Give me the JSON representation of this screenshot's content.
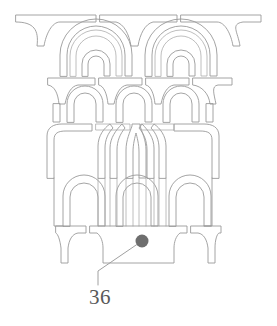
{
  "figure": {
    "background_color": "#ffffff",
    "line_color": "#9a9a9a",
    "line_width": 0.9
  },
  "callout": {
    "number_label": "36",
    "dot_color": "#6e6e6e",
    "dot_radius": 6.5,
    "dot_center_x": 142,
    "dot_center_y": 241,
    "leader_color": "#a0a0a0",
    "leader_points": "142,241 98,271 98,285",
    "label_color": "#595959",
    "label_x": 100,
    "label_y": 297
  },
  "tiers": [
    {
      "name": "top-cornice-band",
      "description": "Three horizontal slab segments with flared bracket ends",
      "y_top": 14,
      "y_bottom": 27
    },
    {
      "name": "upper-arcade",
      "description": "Two large nested semicircular arches each enclosing a smaller arch",
      "y_top": 27,
      "y_bottom": 76,
      "arch_count": 2,
      "sub_arch_count": 2
    },
    {
      "name": "second-cornice-band",
      "description": "Four horizontal slab segments",
      "y_top": 76,
      "y_bottom": 86
    },
    {
      "name": "middle-arcade",
      "description": "Three rounded arches separated by flared piers",
      "y_top": 86,
      "y_bottom": 122,
      "arch_count": 3
    },
    {
      "name": "lancet-tier",
      "description": "Tall pointed lancet arches at center flanked by rounded-corner blocks",
      "y_top": 122,
      "y_bottom": 178,
      "lancet_count": 4
    },
    {
      "name": "lower-arcade",
      "description": "Three rounded arches with continuing vertical ribs",
      "y_top": 178,
      "y_bottom": 226,
      "arch_count": 3
    },
    {
      "name": "base-plinth",
      "description": "Central base block flanked by two flared pier footings",
      "y_top": 226,
      "y_bottom": 263
    }
  ]
}
